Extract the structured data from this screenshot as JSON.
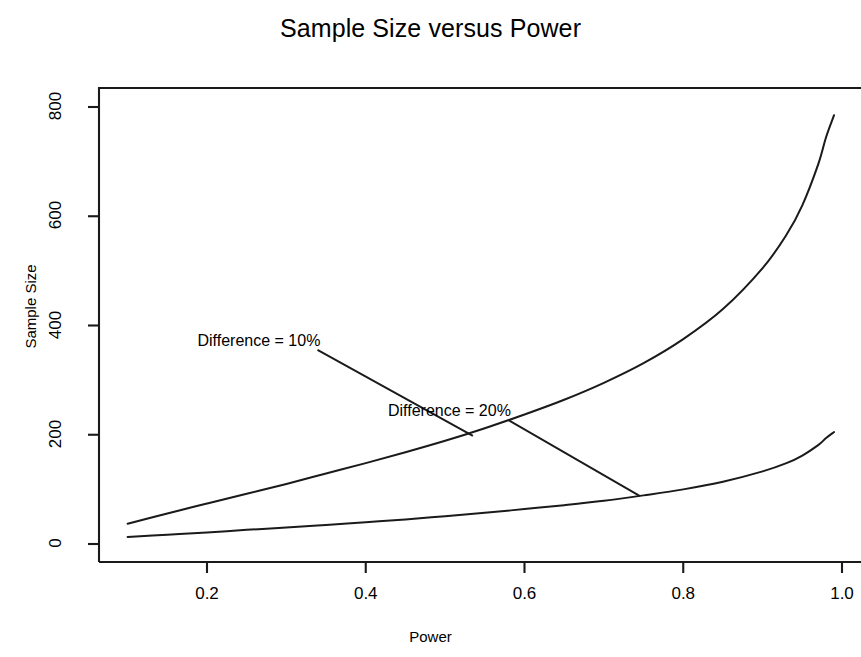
{
  "chart_data": {
    "type": "line",
    "title": "Sample Size versus Power",
    "xlabel": "Power",
    "ylabel": "Sample Size",
    "xlim": [
      0.1,
      1.0
    ],
    "ylim": [
      0,
      830
    ],
    "grid": false,
    "legend_position": "none",
    "xticks": [
      "0.2",
      "0.4",
      "0.6",
      "0.8",
      "1.0"
    ],
    "xtick_values": [
      0.2,
      0.4,
      0.6,
      0.8,
      1.0
    ],
    "yticks": [
      "0",
      "200",
      "400",
      "600",
      "800"
    ],
    "ytick_values": [
      0,
      200,
      400,
      600,
      800
    ],
    "series": [
      {
        "name": "Difference = 10%",
        "x": [
          0.1,
          0.15,
          0.2,
          0.25,
          0.3,
          0.35,
          0.4,
          0.45,
          0.5,
          0.55,
          0.6,
          0.65,
          0.7,
          0.75,
          0.8,
          0.85,
          0.9,
          0.93,
          0.95,
          0.97,
          0.98,
          0.99
        ],
        "values": [
          37,
          56,
          74,
          92,
          110,
          129,
          148,
          168,
          189,
          212,
          237,
          264,
          295,
          331,
          375,
          430,
          505,
          566,
          620,
          695,
          745,
          785
        ]
      },
      {
        "name": "Difference = 20%",
        "x": [
          0.1,
          0.15,
          0.2,
          0.25,
          0.3,
          0.35,
          0.4,
          0.45,
          0.5,
          0.55,
          0.6,
          0.65,
          0.7,
          0.75,
          0.8,
          0.85,
          0.9,
          0.93,
          0.95,
          0.97,
          0.98,
          0.99
        ],
        "values": [
          13,
          17,
          21,
          26,
          30,
          35,
          40,
          45,
          51,
          57,
          64,
          71,
          79,
          89,
          100,
          114,
          133,
          148,
          162,
          181,
          194,
          205
        ]
      }
    ],
    "annotations": [
      {
        "text": "Difference = 10%",
        "text_x": 0.188,
        "text_y": 370,
        "point_x": 0.535,
        "point_y": 198
      },
      {
        "text": "Difference = 20%",
        "text_x": 0.428,
        "text_y": 242,
        "point_x": 0.745,
        "point_y": 88
      }
    ],
    "line_color": "#1a1a1a",
    "axis_color": "#1a1a1a",
    "background_color": "#ffffff"
  }
}
